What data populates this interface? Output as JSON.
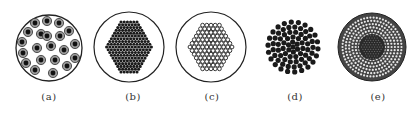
{
  "figure": {
    "stroke_color": "#222222",
    "fill_dark": "#1a1a1a",
    "fill_gray": "#888888",
    "background": "#ffffff",
    "panels": [
      {
        "id": "a",
        "label": "(a)",
        "cx": 49,
        "cy": 48,
        "r": 33,
        "pattern": "sparse ringed dots (dark core, gray ring), ~22 units",
        "outer_circle": true
      },
      {
        "id": "b",
        "label": "(b)",
        "cx": 129,
        "cy": 47,
        "r": 35,
        "pattern": "dense hexagonal pack of dark dots",
        "outer_circle": true
      },
      {
        "id": "c",
        "label": "(c)",
        "cx": 211,
        "cy": 47,
        "r": 35,
        "pattern": "hexagonal pack of hollow white dots with dark outlines",
        "outer_circle": true
      },
      {
        "id": "d",
        "label": "(d)",
        "cx": 293,
        "cy": 47,
        "r": 26,
        "pattern": "concentric rings of dark dots, no casing",
        "outer_circle": false
      },
      {
        "id": "e",
        "label": "(e)",
        "cx": 372,
        "cy": 47,
        "r": 34,
        "pattern": "dense dark core surrounded by concentric hatched rings",
        "outer_circle": false
      }
    ]
  }
}
